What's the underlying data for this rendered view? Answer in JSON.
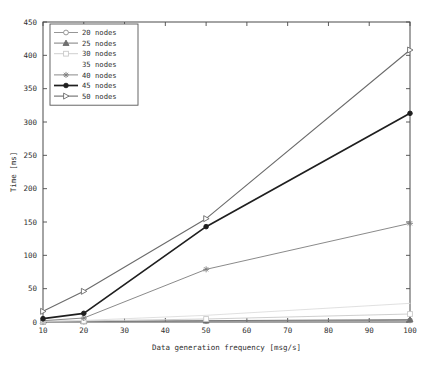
{
  "chart_data": {
    "type": "line",
    "title": "",
    "xlabel": "Data generation frequency [msg/s]",
    "ylabel": "Time [ms]",
    "x": [
      10,
      20,
      50,
      100
    ],
    "xlim": [
      10,
      100
    ],
    "ylim": [
      0,
      450
    ],
    "xticks": [
      10,
      20,
      30,
      40,
      50,
      60,
      70,
      80,
      90,
      100
    ],
    "yticks": [
      0,
      50,
      100,
      150,
      200,
      250,
      300,
      350,
      400,
      450
    ],
    "grid": false,
    "legend_position": "top-left",
    "series": [
      {
        "name": "20 nodes",
        "marker": "circle",
        "color": "#8a8a8a",
        "width": 0.9,
        "values": [
          0.4,
          0.7,
          1.4,
          2.4
        ]
      },
      {
        "name": "25 nodes",
        "marker": "triangle-up",
        "color": "#6f6f6f",
        "width": 0.9,
        "values": [
          0.6,
          1.0,
          2.0,
          3.6
        ]
      },
      {
        "name": "30 nodes",
        "marker": "square",
        "color": "#c9c9c9",
        "width": 0.9,
        "values": [
          1.0,
          1.6,
          4.5,
          12.0
        ]
      },
      {
        "name": "35 nodes",
        "marker": "none",
        "color": "#dcdcdc",
        "width": 0.9,
        "values": [
          1.2,
          2.4,
          10.0,
          28.0
        ]
      },
      {
        "name": "40 nodes",
        "marker": "star",
        "color": "#7d7d7d",
        "width": 0.9,
        "values": [
          2.0,
          6.0,
          79.0,
          148.0
        ]
      },
      {
        "name": "45 nodes",
        "marker": "circle-filled",
        "color": "#1f1f1f",
        "width": 1.7,
        "values": [
          5.0,
          13.0,
          143.0,
          313.0
        ]
      },
      {
        "name": "50 nodes",
        "marker": "triangle-right",
        "color": "#6b6b6b",
        "width": 1.1,
        "values": [
          16.0,
          46.0,
          155.0,
          408.0
        ]
      }
    ]
  },
  "legend": {
    "entries": [
      "20 nodes",
      "25 nodes",
      "30 nodes",
      "35 nodes",
      "40 nodes",
      "45 nodes",
      "50 nodes"
    ]
  },
  "axes": {
    "x_tick_labels": [
      "10",
      "20",
      "30",
      "40",
      "50",
      "60",
      "70",
      "80",
      "90",
      "100"
    ],
    "y_tick_labels": [
      "0",
      "50",
      "100",
      "150",
      "200",
      "250",
      "300",
      "350",
      "400",
      "450"
    ],
    "x_axis_title": "Data generation frequency [msg/s]",
    "y_axis_title": "Time [ms]"
  }
}
